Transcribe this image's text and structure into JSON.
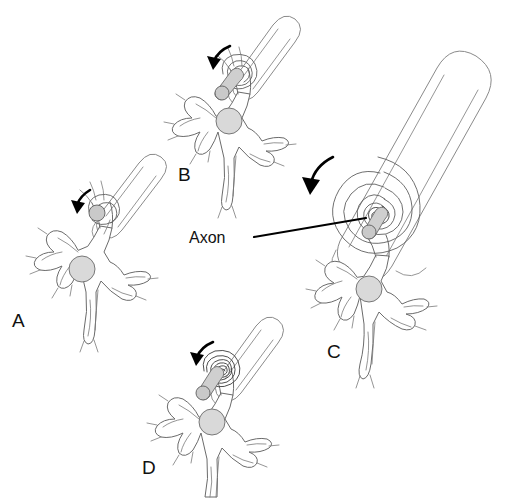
{
  "figure": {
    "background_color": "#ffffff",
    "width": 520,
    "height": 498,
    "line_color": "#6b6b6b",
    "accent_color": "#000000",
    "nucleus_color": "#d9d9d9",
    "axon_color": "#c9c9c9"
  },
  "callouts": [
    {
      "id": "axon",
      "label": "Axon",
      "x": 189,
      "y": 243,
      "leader_from": [
        254,
        237
      ],
      "leader_to": [
        366,
        218
      ]
    }
  ],
  "panels": [
    {
      "id": "A",
      "letter": "A",
      "letter_x": 12,
      "letter_y": 327,
      "wraps": 1,
      "description": "Schwann cell begins to envelop the axon; a single loop of membrane."
    },
    {
      "id": "B",
      "letter": "B",
      "letter_x": 178,
      "letter_y": 181,
      "wraps": 2,
      "description": "Schwann cell has wrapped the axon twice."
    },
    {
      "id": "C",
      "letter": "C",
      "letter_x": 327,
      "letter_y": 358,
      "wraps": 9,
      "description": "Cut-away enlargement showing many concentric myelin layers around the axon."
    },
    {
      "id": "D",
      "letter": "D",
      "letter_x": 142,
      "letter_y": 474,
      "wraps": 6,
      "description": "Compact myelin sheath of several tight turns around the axon."
    }
  ]
}
